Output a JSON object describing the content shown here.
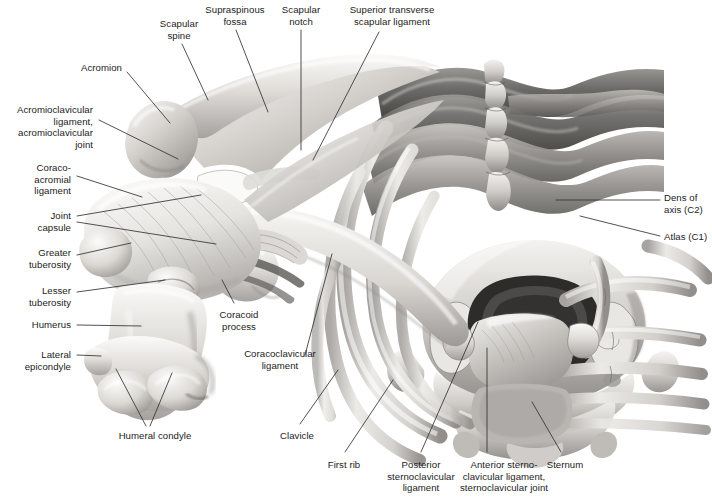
{
  "figure": {
    "background_color": "#ffffff",
    "text_color": "#1b1b1b",
    "leader_color": "#333333",
    "width": 712,
    "height": 499
  },
  "labels": [
    {
      "id": "scapular-spine",
      "text": "Scapular\nspine",
      "align": "center",
      "x": 142,
      "y": 18,
      "w": 74
    },
    {
      "id": "supraspinous-fossa",
      "text": "Supraspinous\nfossa",
      "align": "center",
      "x": 194,
      "y": 4,
      "w": 82
    },
    {
      "id": "scapular-notch",
      "text": "Scapular\nnotch",
      "align": "center",
      "x": 272,
      "y": 4,
      "w": 58
    },
    {
      "id": "superior-transverse",
      "text": "Superior transverse\nscapular ligament",
      "align": "center",
      "x": 334,
      "y": 4,
      "w": 116
    },
    {
      "id": "acromion",
      "text": "Acromion",
      "align": "right",
      "x": 56,
      "y": 62,
      "w": 66
    },
    {
      "id": "acromioclavicular",
      "text": "Acromioclavicular\nligament,\nacromioclavicular\njoint",
      "align": "right",
      "x": 0,
      "y": 104,
      "w": 93
    },
    {
      "id": "coracoacromial",
      "text": "Coraco-\nacromial\nligament",
      "align": "right",
      "x": 8,
      "y": 162,
      "w": 63
    },
    {
      "id": "joint-capsule",
      "text": "Joint\ncapsule",
      "align": "right",
      "x": 16,
      "y": 210,
      "w": 55
    },
    {
      "id": "greater-tuberosity",
      "text": "Greater\ntuberosity",
      "align": "right",
      "x": 3,
      "y": 247,
      "w": 68
    },
    {
      "id": "lesser-tuberosity",
      "text": "Lesser\ntuberosity",
      "align": "right",
      "x": 3,
      "y": 285,
      "w": 68
    },
    {
      "id": "humerus",
      "text": "Humerus",
      "align": "right",
      "x": 12,
      "y": 319,
      "w": 59
    },
    {
      "id": "lateral-epicondyle",
      "text": "Lateral\nepicondyle",
      "align": "right",
      "x": 4,
      "y": 349,
      "w": 67
    },
    {
      "id": "humeral-condyle",
      "text": "Humeral condyle",
      "align": "center",
      "x": 104,
      "y": 430,
      "w": 102
    },
    {
      "id": "coracoid-process",
      "text": "Coracoid\nprocess",
      "align": "center",
      "x": 208,
      "y": 309,
      "w": 62
    },
    {
      "id": "coracoclavicular",
      "text": "Coracoclavicular\nligament",
      "align": "center",
      "x": 228,
      "y": 348,
      "w": 104
    },
    {
      "id": "clavicle",
      "text": "Clavicle",
      "align": "center",
      "x": 270,
      "y": 430,
      "w": 54
    },
    {
      "id": "first-rib",
      "text": "First rib",
      "align": "center",
      "x": 317,
      "y": 459,
      "w": 54
    },
    {
      "id": "posterior-sternoclav",
      "text": "Posterior\nsternoclavicular\nligament",
      "align": "center",
      "x": 377,
      "y": 459,
      "w": 88
    },
    {
      "id": "anterior-sternoclav",
      "text": "Anterior sterno-\nclavicular ligament,\nsternoclavicular joint",
      "align": "center",
      "x": 450,
      "y": 459,
      "w": 108
    },
    {
      "id": "sternum",
      "text": "Sternum",
      "align": "center",
      "x": 537,
      "y": 459,
      "w": 56
    },
    {
      "id": "dens-of-axis",
      "text": "Dens of\naxis (C2)",
      "align": "left",
      "x": 664,
      "y": 192,
      "w": 48
    },
    {
      "id": "atlas",
      "text": "Atlas (C1)",
      "align": "left",
      "x": 664,
      "y": 231,
      "w": 50
    }
  ],
  "leader_lines": [
    {
      "id": "leader-scapular-spine",
      "points": "182,44 208,100"
    },
    {
      "id": "leader-supraspinous-fossa",
      "points": "236,30 268,112"
    },
    {
      "id": "leader-scapular-notch",
      "points": "301,30 301,150"
    },
    {
      "id": "leader-superior-transverse",
      "points": "379,32 313,160"
    },
    {
      "id": "leader-acromion",
      "points": "127,72 170,123"
    },
    {
      "id": "leader-acromioclavicular",
      "points": "99,120 178,159"
    },
    {
      "id": "leader-coracoacromial",
      "points": "77,176 142,197"
    },
    {
      "id": "leader-joint-capsule-a",
      "points": "77,216 201,195"
    },
    {
      "id": "leader-joint-capsule-b",
      "points": "77,222 216,244"
    },
    {
      "id": "leader-greater-tuberosity",
      "points": "77,255 131,243"
    },
    {
      "id": "leader-lesser-tuberosity",
      "points": "77,292 165,280"
    },
    {
      "id": "leader-humerus",
      "points": "77,325 141,326"
    },
    {
      "id": "leader-lateral-epicondyle",
      "points": "77,355 101,356"
    },
    {
      "id": "leader-humeral-condyle-a",
      "points": "146,426 116,369"
    },
    {
      "id": "leader-humeral-condyle-b",
      "points": "150,426 172,373"
    },
    {
      "id": "leader-coracoid-process",
      "points": "234,303 222,280"
    },
    {
      "id": "leader-coracoclavicular",
      "points": "305,355 332,254"
    },
    {
      "id": "leader-clavicle",
      "points": "300,424 338,370"
    },
    {
      "id": "leader-first-rib",
      "points": "345,452 393,380"
    },
    {
      "id": "leader-posterior-sternoclav",
      "points": "421,452 478,322"
    },
    {
      "id": "leader-anterior-sternoclav",
      "points": "487,452 487,348"
    },
    {
      "id": "leader-sternum",
      "points": "561,452 532,402"
    },
    {
      "id": "leader-dens-of-axis",
      "points": "660,200 556,200"
    },
    {
      "id": "leader-atlas",
      "points": "660,236 580,216"
    }
  ],
  "illustration": {
    "view": "anterosuperior",
    "style": "grayscale medical airbrush rendering",
    "structures": [
      "scapula with spine and acromion",
      "humerus with greater and lesser tuberosity",
      "glenohumeral joint capsule",
      "clavicle",
      "sternum and sternoclavicular joints",
      "first rib and thoracic ribs",
      "cervical vertebrae: atlas (C1) and dens of axis (C2)"
    ],
    "palette": {
      "bone_light": "#f2f0ee",
      "bone_mid": "#c9c6c2",
      "bone_shadow": "#8e8b88",
      "rib_dark": "#6f6d6b",
      "rib_darkest": "#4a4847",
      "ligament": "#e3e1de"
    }
  }
}
